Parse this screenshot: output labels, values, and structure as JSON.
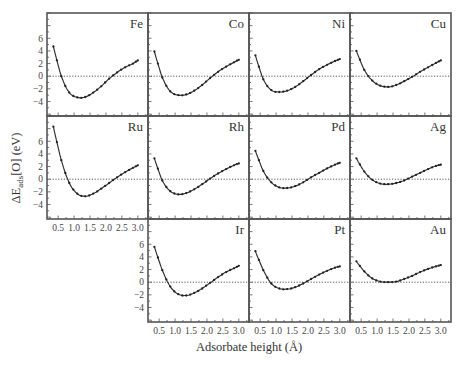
{
  "chart_data": {
    "type": "line",
    "layout": "small-multiples grid, 3 rows x 4 columns (11 panels, row 3 column 1 empty)",
    "xlabel": "Adsorbate height (Å)",
    "ylabel": "ΔE_ads[O] (eV)",
    "xlim": [
      0.15,
      3.32
    ],
    "ylim": [
      -6.3,
      10.0
    ],
    "xticks": [
      0.5,
      1.0,
      1.5,
      2.0,
      2.5,
      3.0
    ],
    "xtick_labels": [
      "0.5",
      "1.0",
      "1.5",
      "2.0",
      "2.5",
      "3.0"
    ],
    "yticks": [
      -4,
      -2,
      0,
      2,
      4,
      6
    ],
    "ytick_labels": [
      "−4",
      "−2",
      "0",
      "2",
      "4",
      "6"
    ],
    "reference_line": {
      "y": 0,
      "style": "dotted"
    },
    "grid": false,
    "legend": null,
    "x": [
      0.35,
      0.6,
      0.85,
      1.1,
      1.35,
      1.6,
      1.85,
      2.1,
      2.35,
      2.6,
      2.85,
      3.0
    ],
    "series": [
      {
        "name": "Fe",
        "row": 0,
        "col": 0,
        "values": [
          4.7,
          0.0,
          -2.6,
          -3.35,
          -3.3,
          -2.6,
          -1.6,
          -0.4,
          0.6,
          1.4,
          2.0,
          2.5
        ]
      },
      {
        "name": "Co",
        "row": 0,
        "col": 1,
        "values": [
          3.9,
          -0.2,
          -2.4,
          -3.0,
          -2.9,
          -2.3,
          -1.4,
          -0.3,
          0.7,
          1.5,
          2.2,
          2.6
        ]
      },
      {
        "name": "Ni",
        "row": 0,
        "col": 2,
        "values": [
          3.3,
          -0.5,
          -2.2,
          -2.5,
          -2.3,
          -1.7,
          -0.8,
          0.2,
          1.1,
          1.8,
          2.4,
          2.7
        ]
      },
      {
        "name": "Cu",
        "row": 0,
        "col": 3,
        "values": [
          4.0,
          1.0,
          -0.7,
          -1.5,
          -1.7,
          -1.4,
          -0.8,
          -0.1,
          0.7,
          1.4,
          2.1,
          2.5
        ]
      },
      {
        "name": "Ru",
        "row": 1,
        "col": 0,
        "values": [
          8.3,
          3.0,
          -0.6,
          -2.3,
          -2.7,
          -2.3,
          -1.5,
          -0.6,
          0.3,
          1.1,
          1.8,
          2.2
        ]
      },
      {
        "name": "Rh",
        "row": 1,
        "col": 1,
        "values": [
          3.3,
          -0.2,
          -1.9,
          -2.4,
          -2.2,
          -1.6,
          -0.8,
          0.1,
          0.9,
          1.6,
          2.2,
          2.5
        ]
      },
      {
        "name": "Pd",
        "row": 1,
        "col": 2,
        "values": [
          4.5,
          1.3,
          -0.5,
          -1.3,
          -1.4,
          -1.1,
          -0.5,
          0.3,
          1.0,
          1.7,
          2.3,
          2.6
        ]
      },
      {
        "name": "Ag",
        "row": 1,
        "col": 3,
        "values": [
          3.3,
          1.2,
          -0.1,
          -0.7,
          -0.8,
          -0.6,
          -0.2,
          0.4,
          1.0,
          1.6,
          2.1,
          2.3
        ]
      },
      {
        "name": "Ir",
        "row": 2,
        "col": 1,
        "values": [
          5.6,
          1.9,
          -0.7,
          -1.9,
          -2.1,
          -1.7,
          -1.0,
          -0.1,
          0.8,
          1.6,
          2.2,
          2.6
        ]
      },
      {
        "name": "Pt",
        "row": 2,
        "col": 2,
        "values": [
          4.9,
          1.9,
          -0.2,
          -1.0,
          -1.1,
          -0.8,
          -0.2,
          0.5,
          1.2,
          1.8,
          2.3,
          2.5
        ]
      },
      {
        "name": "Au",
        "row": 2,
        "col": 3,
        "values": [
          3.3,
          1.7,
          0.6,
          0.1,
          0.0,
          0.1,
          0.5,
          1.0,
          1.6,
          2.1,
          2.5,
          2.7
        ]
      }
    ],
    "ytick_label_panels": [
      "Fe",
      "Ru",
      "Ir"
    ],
    "xtick_label_panels": [
      "Ru",
      "Ir",
      "Pt",
      "Au"
    ]
  },
  "labels": {
    "xaxis_title": "Adsorbate height (Å)",
    "yaxis_title_prefix": "ΔE",
    "yaxis_title_subscript": "ads",
    "yaxis_title_suffix": "[O] (eV)"
  }
}
